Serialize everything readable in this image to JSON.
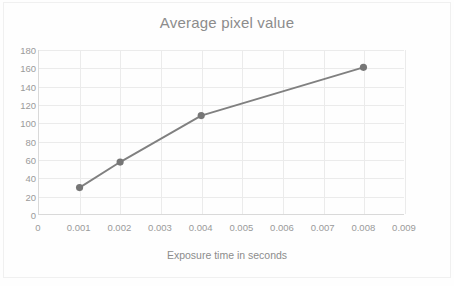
{
  "chart_data": {
    "type": "line",
    "title": "Average pixel value",
    "xlabel": "Exposure time in seconds",
    "ylabel": "",
    "x": [
      0.001,
      0.002,
      0.004,
      0.008
    ],
    "values": [
      29,
      57,
      108,
      161
    ],
    "series": [
      {
        "name": "Average pixel value",
        "x": [
          0.001,
          0.002,
          0.004,
          0.008
        ],
        "values": [
          29,
          57,
          108,
          161
        ]
      }
    ],
    "xlim": [
      0,
      0.009
    ],
    "ylim": [
      0,
      180
    ],
    "xticks": [
      0,
      0.001,
      0.002,
      0.003,
      0.004,
      0.005,
      0.006,
      0.007,
      0.008,
      0.009
    ],
    "xtick_labels": [
      "0",
      "0.001",
      "0.002",
      "0.003",
      "0.004",
      "0.005",
      "0.006",
      "0.007",
      "0.008",
      "0.009"
    ],
    "yticks": [
      0,
      20,
      40,
      60,
      80,
      100,
      120,
      140,
      160,
      180
    ],
    "ytick_labels": [
      "0",
      "20",
      "40",
      "60",
      "80",
      "100",
      "120",
      "140",
      "160",
      "180"
    ],
    "grid": true,
    "legend": false,
    "colors": {
      "series_line": "#808080",
      "marker": "#767676",
      "gridline": "#ebebeb",
      "axis_line": "#d9d9d9",
      "tick_label": "#9a9a9a",
      "title_text": "#8c8c8c",
      "plot_background": "#ffffff"
    }
  }
}
